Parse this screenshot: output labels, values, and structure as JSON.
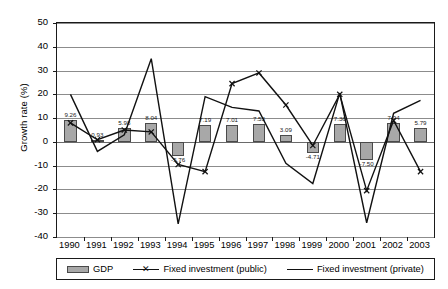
{
  "chart_data": {
    "type": "bar",
    "title": "",
    "subtitle": "",
    "xlabel": "",
    "ylabel": "Growth rate (%)",
    "categories": [
      "1990",
      "1991",
      "1992",
      "1993",
      "1994",
      "1995",
      "1996",
      "1997",
      "1998",
      "1999",
      "2000",
      "2001",
      "2002",
      "2003"
    ],
    "ylim": [
      -40,
      50
    ],
    "ytick_labels": [
      "50",
      "40",
      "30",
      "20",
      "10",
      "0",
      "-10",
      "-20",
      "-30",
      "-40"
    ],
    "ytick_values": [
      50,
      40,
      30,
      20,
      10,
      0,
      -10,
      -20,
      -30,
      -40
    ],
    "grid": true,
    "legend_position": "bottom",
    "series": [
      {
        "name": "GDP",
        "type": "bar",
        "color": "#a8a8a8",
        "values": [
          9.26,
          0.93,
          5.98,
          8.04,
          -5.76,
          7.19,
          7.01,
          7.53,
          3.09,
          -4.71,
          7.36,
          -7.5,
          7.94,
          5.79
        ],
        "labels": [
          "9.26",
          "0.93",
          "5.98",
          "8.04",
          "-5.76",
          "7.19",
          "7.01",
          "7.53",
          "3.09",
          "-4.71",
          "7.36",
          "-7.50",
          "7.94",
          "5.79"
        ]
      },
      {
        "name": "Fixed investment (public)",
        "type": "line",
        "marker": "x",
        "color": "#111111",
        "values": [
          8.0,
          0.9,
          5.0,
          4.2,
          -9.5,
          -12.5,
          24.5,
          29.0,
          15.5,
          -1.5,
          20.0,
          -20.5,
          9.0,
          -12.5
        ]
      },
      {
        "name": "Fixed investment (private)",
        "type": "line",
        "marker": "none",
        "color": "#111111",
        "values": [
          20.0,
          -4.0,
          3.0,
          35.0,
          -34.5,
          19.0,
          14.5,
          13.0,
          -9.0,
          -17.5,
          20.5,
          -34.0,
          12.0,
          17.5
        ]
      }
    ]
  },
  "legend": {
    "entries": [
      {
        "label": "GDP",
        "kind": "bar"
      },
      {
        "label": "Fixed investment (public)",
        "kind": "line-x"
      },
      {
        "label": "Fixed investment (private)",
        "kind": "line-plain"
      }
    ]
  }
}
